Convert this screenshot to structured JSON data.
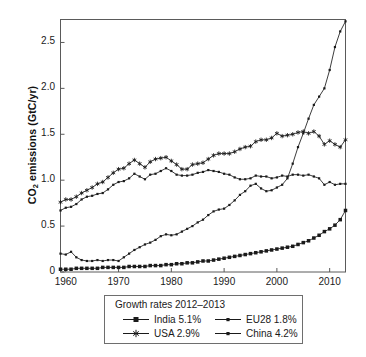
{
  "axes": {
    "ylabel_prefix": "CO",
    "ylabel_sub": "2",
    "ylabel_suffix": " emissions (GtC/yr)",
    "ytick_labels": [
      "2.5",
      "2.0",
      "1.5",
      "1.0",
      "0.5",
      "0"
    ],
    "xtick_labels": [
      "1960",
      "1970",
      "1980",
      "1990",
      "2000",
      "2010"
    ]
  },
  "legend": {
    "title": "Growth rates 2012–2013",
    "entries": [
      {
        "label": "India 5.1%",
        "marker": "filled-square",
        "color": "#1a1a1a"
      },
      {
        "label": "USA 2.9%",
        "marker": "star",
        "color": "#1a1a1a"
      },
      {
        "label": "EU28 1.8%",
        "marker": "small-dot",
        "color": "#1a1a1a"
      },
      {
        "label": "China 4.2%",
        "marker": "small-dot",
        "color": "#1a1a1a"
      }
    ]
  },
  "chart_data": {
    "type": "line",
    "title": "",
    "xlabel": "",
    "ylabel": "CO2 emissions (GtC/yr)",
    "xlim": [
      1959,
      2013
    ],
    "ylim": [
      0,
      2.75
    ],
    "xticks": [
      1960,
      1970,
      1980,
      1990,
      2000,
      2010
    ],
    "yticks": [
      0,
      0.5,
      1.0,
      1.5,
      2.0,
      2.5
    ],
    "grid": false,
    "legend_position": "below-axes",
    "legend_title": "Growth rates 2012–2013",
    "x": [
      1959,
      1960,
      1961,
      1962,
      1963,
      1964,
      1965,
      1966,
      1967,
      1968,
      1969,
      1970,
      1971,
      1972,
      1973,
      1974,
      1975,
      1976,
      1977,
      1978,
      1979,
      1980,
      1981,
      1982,
      1983,
      1984,
      1985,
      1986,
      1987,
      1988,
      1989,
      1990,
      1991,
      1992,
      1993,
      1994,
      1995,
      1996,
      1997,
      1998,
      1999,
      2000,
      2001,
      2002,
      2003,
      2004,
      2005,
      2006,
      2007,
      2008,
      2009,
      2010,
      2011,
      2012,
      2013
    ],
    "series": [
      {
        "name": "China 4.2%",
        "marker": "small-dot",
        "values": [
          0.2,
          0.19,
          0.22,
          0.16,
          0.13,
          0.12,
          0.12,
          0.13,
          0.12,
          0.13,
          0.13,
          0.12,
          0.16,
          0.2,
          0.24,
          0.27,
          0.3,
          0.32,
          0.35,
          0.39,
          0.41,
          0.4,
          0.41,
          0.44,
          0.47,
          0.5,
          0.54,
          0.57,
          0.62,
          0.66,
          0.68,
          0.69,
          0.73,
          0.78,
          0.84,
          0.88,
          0.94,
          0.96,
          0.91,
          0.88,
          0.89,
          0.92,
          0.95,
          1.02,
          1.18,
          1.36,
          1.51,
          1.67,
          1.82,
          1.91,
          2.0,
          2.2,
          2.45,
          2.62,
          2.73
        ]
      },
      {
        "name": "USA 2.9%",
        "marker": "star",
        "values": [
          0.76,
          0.79,
          0.79,
          0.82,
          0.86,
          0.89,
          0.92,
          0.96,
          0.98,
          1.03,
          1.08,
          1.12,
          1.13,
          1.18,
          1.22,
          1.18,
          1.14,
          1.2,
          1.23,
          1.24,
          1.25,
          1.21,
          1.17,
          1.12,
          1.12,
          1.17,
          1.18,
          1.19,
          1.23,
          1.27,
          1.29,
          1.29,
          1.29,
          1.31,
          1.34,
          1.36,
          1.37,
          1.42,
          1.44,
          1.44,
          1.46,
          1.51,
          1.48,
          1.49,
          1.5,
          1.52,
          1.53,
          1.51,
          1.53,
          1.48,
          1.39,
          1.43,
          1.39,
          1.36,
          1.44
        ]
      },
      {
        "name": "EU28 1.8%",
        "marker": "small-dot",
        "values": [
          0.67,
          0.7,
          0.71,
          0.74,
          0.79,
          0.82,
          0.83,
          0.85,
          0.86,
          0.9,
          0.95,
          0.98,
          0.99,
          1.02,
          1.07,
          1.04,
          1.01,
          1.06,
          1.07,
          1.1,
          1.13,
          1.1,
          1.06,
          1.05,
          1.05,
          1.06,
          1.08,
          1.09,
          1.11,
          1.1,
          1.09,
          1.07,
          1.06,
          1.03,
          1.01,
          1.01,
          1.02,
          1.05,
          1.04,
          1.04,
          1.02,
          1.03,
          1.05,
          1.04,
          1.06,
          1.06,
          1.05,
          1.06,
          1.04,
          1.02,
          0.95,
          0.98,
          0.95,
          0.96,
          0.96
        ]
      },
      {
        "name": "India 5.1%",
        "marker": "filled-square",
        "values": [
          0.03,
          0.03,
          0.03,
          0.04,
          0.04,
          0.04,
          0.04,
          0.04,
          0.05,
          0.05,
          0.05,
          0.05,
          0.05,
          0.06,
          0.06,
          0.06,
          0.06,
          0.07,
          0.07,
          0.07,
          0.08,
          0.08,
          0.09,
          0.09,
          0.1,
          0.1,
          0.11,
          0.12,
          0.12,
          0.13,
          0.14,
          0.15,
          0.16,
          0.17,
          0.18,
          0.19,
          0.2,
          0.21,
          0.22,
          0.23,
          0.24,
          0.25,
          0.26,
          0.27,
          0.28,
          0.3,
          0.32,
          0.34,
          0.37,
          0.4,
          0.44,
          0.47,
          0.51,
          0.57,
          0.67
        ]
      }
    ]
  }
}
